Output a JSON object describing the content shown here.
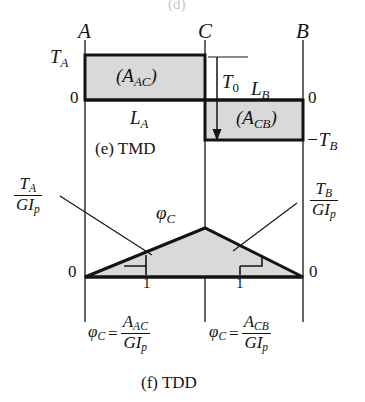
{
  "figure": {
    "top_partial_caption": "(d)",
    "caption_e": "(e) TMD",
    "caption_f": "(f) TDD"
  },
  "nodes": {
    "a": "A",
    "c": "C",
    "b": "B"
  },
  "tmd": {
    "left_top_label": "T",
    "left_top_sub": "A",
    "left_zero": "0",
    "right_zero": "0",
    "right_bottom_label": "−T",
    "right_bottom_sub": "B",
    "area_ac": "(A",
    "area_ac_sub": "AC",
    "area_ac_close": ")",
    "area_cb": "(A",
    "area_cb_sub": "CB",
    "area_cb_close": ")",
    "length_a": "L",
    "length_a_sub": "A",
    "length_b": "L",
    "length_b_sub": "B",
    "torque_t0": "T",
    "torque_t0_sub": "0"
  },
  "tdd": {
    "left_frac_num": "T",
    "left_frac_num_sub": "A",
    "left_frac_den": "GI",
    "left_frac_den_sub": "p",
    "right_frac_num": "T",
    "right_frac_num_sub": "B",
    "right_frac_den": "GI",
    "right_frac_den_sub": "p",
    "apex_label": "φ",
    "apex_label_sub": "C",
    "left_zero": "0",
    "right_zero": "0",
    "slope_one_left": "1",
    "slope_one_right": "1",
    "eq_left_phi": "φ",
    "eq_left_phi_sub": "C",
    "eq_left_equals": "=",
    "eq_left_num": "A",
    "eq_left_num_sub": "AC",
    "eq_left_den": "GI",
    "eq_left_den_sub": "p",
    "eq_right_phi": "φ",
    "eq_right_phi_sub": "C",
    "eq_right_equals": "=",
    "eq_right_num": "A",
    "eq_right_num_sub": "CB",
    "eq_right_den": "GI",
    "eq_right_den_sub": "p"
  },
  "geometry": {
    "line_a_x": 85,
    "line_c_x": 205,
    "line_b_x": 303,
    "tmd_top_y": 55,
    "tmd_mid_y": 100,
    "tmd_bot_y": 140,
    "tdd_base_y": 277,
    "tdd_apex_y": 228
  },
  "colors": {
    "fill": "#d9d9d9",
    "stroke": "#141414",
    "background": "#ffffff"
  }
}
